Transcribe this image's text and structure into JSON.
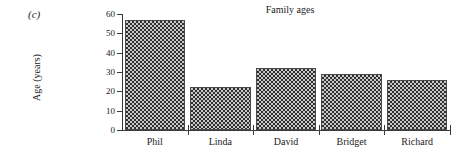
{
  "figure": {
    "part_label": "(c)"
  },
  "chart_data": {
    "type": "bar",
    "title": "Family ages",
    "xlabel": "",
    "ylabel": "Age (years)",
    "categories": [
      "Phil",
      "Linda",
      "David",
      "Bridget",
      "Richard"
    ],
    "values": [
      57,
      22,
      32,
      29,
      26
    ],
    "ylim": [
      0,
      60
    ],
    "yticks": [
      0,
      10,
      20,
      30,
      40,
      50,
      60
    ],
    "ytick_labels": [
      "0",
      "10",
      "20",
      "30",
      "40",
      "50",
      "60"
    ],
    "grid": false,
    "legend": null,
    "bar_fill": "checkerboard",
    "colors": {
      "axis": "#3a3a3a",
      "bar_border": "#4a4a4a",
      "bar_fill_dark": "#2f2f2f",
      "bar_fill_light": "#c9c9c9",
      "text": "#222222",
      "background": "#ffffff"
    }
  }
}
